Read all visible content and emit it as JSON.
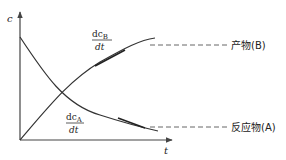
{
  "diagram": {
    "y_axis_label": "c",
    "x_axis_label": "t",
    "colors": {
      "line": "#333333",
      "dash": "#555555",
      "axis": "#444444",
      "background": "#ffffff"
    },
    "curves": [
      {
        "id": "product-B",
        "label": "产物(B)",
        "shape": "rising saturating",
        "rate_label": {
          "numerator": "dc",
          "subscript": "B",
          "denominator": "dt"
        }
      },
      {
        "id": "reactant-A",
        "label": "反应物(A)",
        "shape": "decaying",
        "rate_label": {
          "numerator": "dc",
          "subscript": "A",
          "denominator": "dt"
        }
      }
    ]
  }
}
